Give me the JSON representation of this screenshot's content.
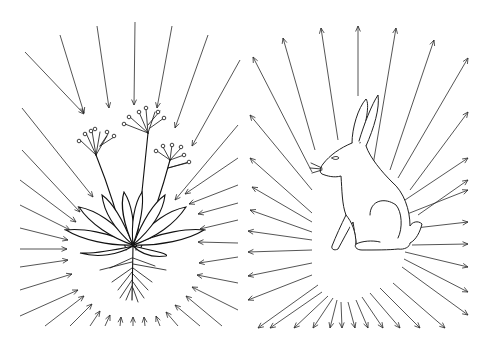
{
  "figure": {
    "panels": [
      {
        "id": "plant",
        "subject": "rosette plant with flowering stalks and roots",
        "arrow_direction": "inward",
        "center": [
          133,
          240
        ],
        "arrows": [
          [
            25,
            52,
            84,
            114
          ],
          [
            60,
            35,
            84,
            113
          ],
          [
            97,
            26,
            109,
            108
          ],
          [
            135,
            22,
            134,
            105
          ],
          [
            172,
            26,
            157,
            108
          ],
          [
            208,
            35,
            175,
            128
          ],
          [
            240,
            60,
            192,
            146
          ],
          [
            22,
            108,
            93,
            197
          ],
          [
            22,
            150,
            80,
            212
          ],
          [
            20,
            180,
            76,
            222
          ],
          [
            20,
            205,
            70,
            230
          ],
          [
            20,
            228,
            68,
            240
          ],
          [
            20,
            249,
            67,
            249
          ],
          [
            20,
            267,
            68,
            260
          ],
          [
            20,
            290,
            72,
            274
          ],
          [
            20,
            316,
            78,
            290
          ],
          [
            45,
            326,
            84,
            296
          ],
          [
            70,
            326,
            92,
            304
          ],
          [
            90,
            326,
            100,
            311
          ],
          [
            105,
            326,
            110,
            315
          ],
          [
            120,
            326,
            121,
            317
          ],
          [
            133,
            326,
            133,
            317
          ],
          [
            145,
            326,
            144,
            317
          ],
          [
            160,
            326,
            156,
            316
          ],
          [
            178,
            326,
            166,
            312
          ],
          [
            200,
            326,
            175,
            305
          ],
          [
            222,
            326,
            186,
            296
          ],
          [
            238,
            310,
            192,
            287
          ],
          [
            238,
            283,
            197,
            275
          ],
          [
            238,
            257,
            199,
            263
          ],
          [
            238,
            243,
            198,
            242
          ],
          [
            238,
            220,
            200,
            229
          ],
          [
            238,
            203,
            198,
            214
          ],
          [
            238,
            185,
            189,
            204
          ],
          [
            238,
            158,
            185,
            194
          ],
          [
            238,
            125,
            175,
            200
          ]
        ]
      },
      {
        "id": "hare",
        "subject": "seated hare in profile",
        "arrow_direction": "outward",
        "center": [
          345,
          250
        ],
        "arrows": [
          [
            315,
            150,
            283,
            38
          ],
          [
            338,
            140,
            321,
            28
          ],
          [
            358,
            96,
            358,
            26
          ],
          [
            373,
            165,
            396,
            28
          ],
          [
            390,
            170,
            434,
            40
          ],
          [
            398,
            178,
            468,
            58
          ],
          [
            312,
            172,
            253,
            57
          ],
          [
            312,
            190,
            250,
            115
          ],
          [
            312,
            213,
            250,
            158
          ],
          [
            312,
            222,
            252,
            187
          ],
          [
            312,
            232,
            250,
            210
          ],
          [
            312,
            240,
            248,
            231
          ],
          [
            312,
            250,
            248,
            252
          ],
          [
            312,
            263,
            248,
            276
          ],
          [
            312,
            275,
            248,
            300
          ],
          [
            318,
            285,
            258,
            328
          ],
          [
            322,
            292,
            270,
            328
          ],
          [
            328,
            296,
            294,
            328
          ],
          [
            333,
            298,
            313,
            328
          ],
          [
            337,
            300,
            330,
            328
          ],
          [
            341,
            302,
            342,
            328
          ],
          [
            348,
            302,
            355,
            328
          ],
          [
            356,
            300,
            368,
            328
          ],
          [
            362,
            297,
            383,
            328
          ],
          [
            370,
            293,
            400,
            328
          ],
          [
            380,
            288,
            420,
            328
          ],
          [
            393,
            283,
            445,
            328
          ],
          [
            402,
            267,
            468,
            315
          ],
          [
            404,
            259,
            468,
            292
          ],
          [
            405,
            252,
            468,
            267
          ],
          [
            412,
            245,
            468,
            244
          ],
          [
            398,
            230,
            468,
            222
          ],
          [
            397,
            218,
            468,
            190
          ],
          [
            418,
            215,
            468,
            180
          ],
          [
            402,
            202,
            468,
            158
          ],
          [
            410,
            190,
            468,
            112
          ]
        ]
      }
    ]
  }
}
